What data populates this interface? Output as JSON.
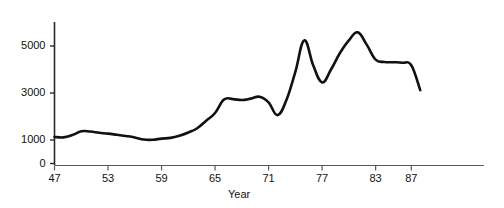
{
  "chart_data": {
    "type": "line",
    "title": "",
    "subtitle": "",
    "xlabel": "Year",
    "ylabel": "",
    "grid": false,
    "legend": null,
    "xlim": [
      46,
      89
    ],
    "ylim": [
      0,
      6000
    ],
    "x_tick_labels": [
      "47",
      "53",
      "59",
      "65",
      "71",
      "77",
      "83",
      "87"
    ],
    "x_tick_values": [
      47,
      53,
      59,
      65,
      71,
      77,
      83,
      87
    ],
    "y_tick_labels": [
      "0",
      "1000",
      "3000",
      "5000"
    ],
    "y_tick_values": [
      0,
      1000,
      3000,
      5000
    ],
    "series": [
      {
        "name": "value",
        "x": [
          47,
          48,
          49,
          50,
          51,
          52,
          53,
          54,
          55,
          56,
          57,
          58,
          59,
          60,
          61,
          62,
          63,
          64,
          65,
          66,
          67,
          68,
          69,
          70,
          71,
          72,
          73,
          74,
          75,
          76,
          77,
          78,
          79,
          80,
          81,
          82,
          83,
          84,
          85,
          86,
          87,
          88
        ],
        "values": [
          1130,
          1110,
          1210,
          1370,
          1360,
          1310,
          1270,
          1220,
          1170,
          1110,
          1020,
          1010,
          1060,
          1090,
          1180,
          1320,
          1500,
          1820,
          2150,
          2720,
          2740,
          2700,
          2760,
          2840,
          2600,
          2060,
          2700,
          3900,
          5240,
          4180,
          3450,
          4000,
          4700,
          5240,
          5580,
          5060,
          4420,
          4320,
          4310,
          4290,
          4180,
          3120
        ],
        "color": "#111111"
      }
    ],
    "annotations": []
  },
  "axis": {
    "x_title": "Year"
  }
}
